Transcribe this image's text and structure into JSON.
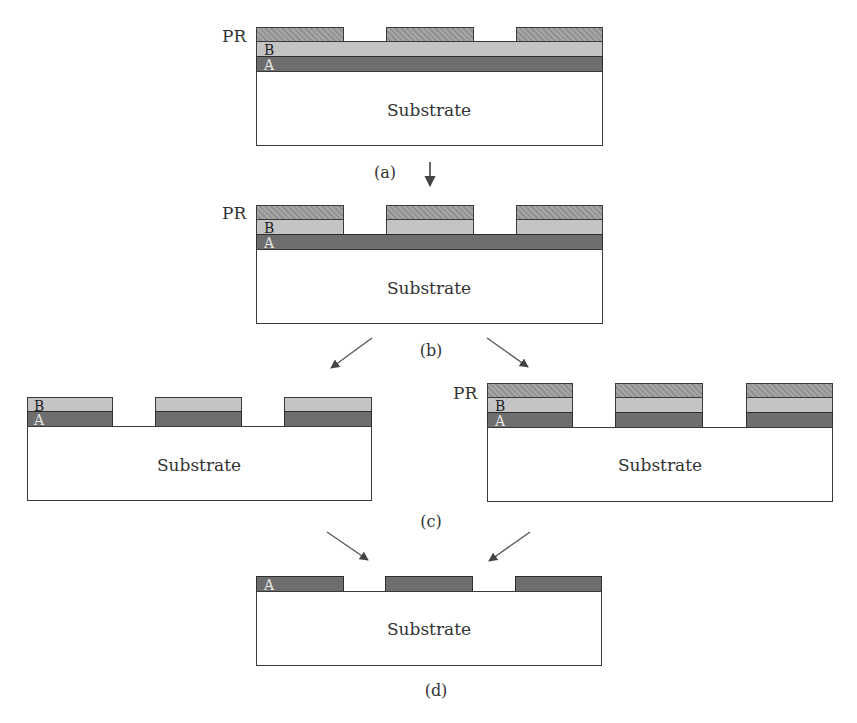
{
  "labels": {
    "substrate": "Substrate",
    "pr": "PR",
    "layer_a": "A",
    "layer_b": "B"
  },
  "steps": [
    {
      "id": "a",
      "caption": "(a)",
      "description": "Photoresist patterned on top of stacked layers B over A over substrate"
    },
    {
      "id": "b",
      "caption": "(b)",
      "description": "Layer B etched through photoresist openings"
    },
    {
      "id": "c",
      "caption": "(c)",
      "description": "Two alternatives: PR stripped leaving B/A stack, or layer A etched with PR still present"
    },
    {
      "id": "d",
      "caption": "(d)",
      "description": "Patterned layer A remaining on substrate"
    }
  ],
  "colors": {
    "layer_a": "#6e6e6e",
    "layer_b": "#c4c4c4",
    "photoresist": "#9a9a9a",
    "substrate": "#ffffff",
    "arrow": "#555555"
  }
}
